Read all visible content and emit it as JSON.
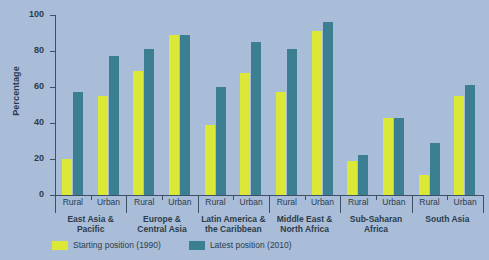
{
  "chart": {
    "ylabel": "Percentage",
    "title_cropped": "",
    "yticks": [
      "0",
      "20",
      "40",
      "60",
      "80",
      "100"
    ]
  },
  "legend": {
    "items": [
      {
        "label": "Starting position (1990)",
        "color": "#dbe838",
        "key": "start"
      },
      {
        "label": "Latest position (2010)",
        "color": "#3d7f92",
        "key": "latest"
      }
    ]
  },
  "groups": [
    {
      "name": "East Asia &\nPacific",
      "sub": [
        "Rural",
        "Urban"
      ]
    },
    {
      "name": "Europe &\nCentral Asia",
      "sub": [
        "Rural",
        "Urban"
      ]
    },
    {
      "name": "Latin America &\nthe Caribbean",
      "sub": [
        "Rural",
        "Urban"
      ]
    },
    {
      "name": "Middle East &\nNorth Africa",
      "sub": [
        "Rural",
        "Urban"
      ]
    },
    {
      "name": "Sub-Saharan\nAfrica",
      "sub": [
        "Rural",
        "Urban"
      ]
    },
    {
      "name": "South Asia",
      "sub": [
        "Rural",
        "Urban"
      ]
    }
  ],
  "chart_data": {
    "type": "bar",
    "title": "",
    "xlabel": "",
    "ylabel": "Percentage",
    "ylim": [
      0,
      100
    ],
    "yticks": [
      0,
      20,
      40,
      60,
      80,
      100
    ],
    "grid": false,
    "legend_position": "bottom-left",
    "categories": [
      "East Asia & Pacific - Rural",
      "East Asia & Pacific - Urban",
      "Europe & Central Asia - Rural",
      "Europe & Central Asia - Urban",
      "Latin America & the Caribbean - Rural",
      "Latin America & the Caribbean - Urban",
      "Middle East & North Africa - Rural",
      "Middle East & North Africa - Urban",
      "Sub-Saharan Africa - Rural",
      "Sub-Saharan Africa - Urban",
      "South Asia - Rural",
      "South Asia - Urban"
    ],
    "series": [
      {
        "name": "Starting position (1990)",
        "color": "#dbe838",
        "values": [
          20,
          55,
          69,
          89,
          39,
          68,
          57,
          91,
          19,
          43,
          11,
          55
        ]
      },
      {
        "name": "Latest position (2010)",
        "color": "#3d7f92",
        "values": [
          57,
          77,
          81,
          89,
          60,
          85,
          81,
          96,
          22,
          43,
          29,
          61
        ]
      }
    ]
  },
  "colors": {
    "background": "#a9bcd8",
    "axis": "#3d5166",
    "text": "#2c3c4c",
    "start": "#dbe838",
    "latest": "#3d7f92"
  }
}
